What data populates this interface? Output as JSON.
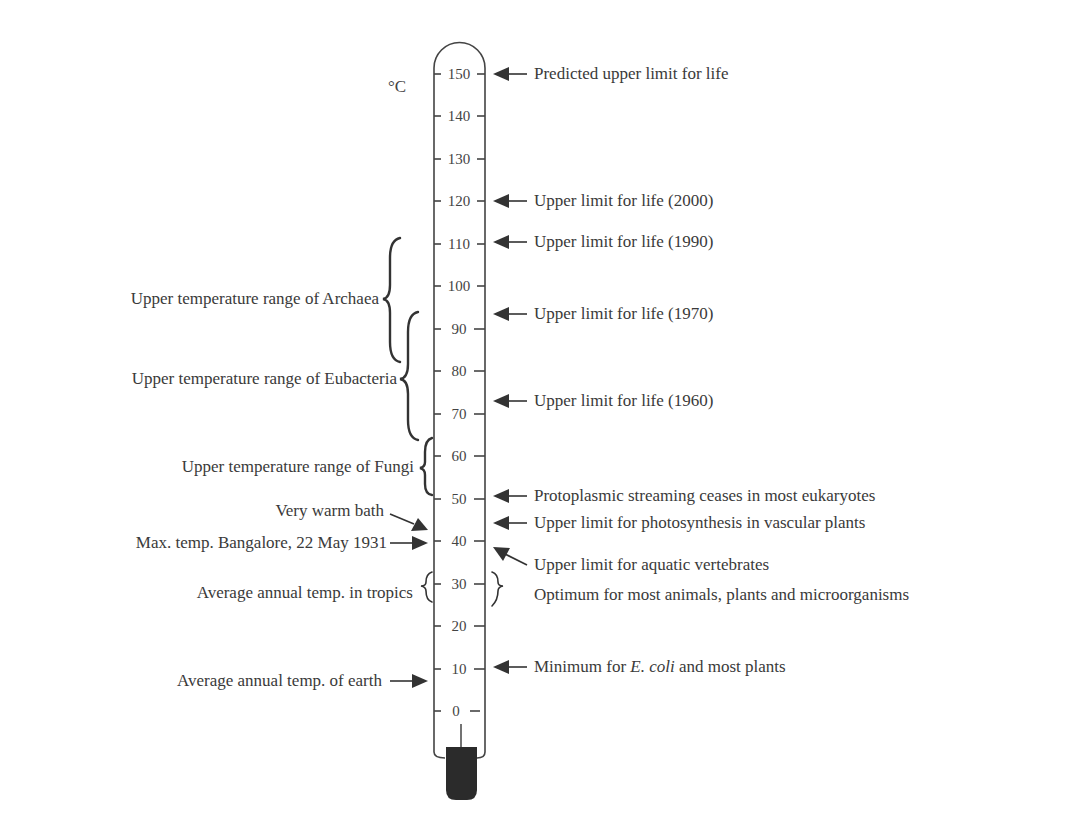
{
  "diagram": {
    "type": "thermometer-scale",
    "unit": "°C",
    "scale": {
      "min": 0,
      "max": 150,
      "step": 10,
      "ticks": [
        "150",
        "140",
        "130",
        "120",
        "110",
        "100",
        "90",
        "80",
        "70",
        "60",
        "50",
        "40",
        "30",
        "20",
        "10",
        "0"
      ]
    },
    "right_annotations": [
      {
        "id": "predicted-upper-limit",
        "text": "Predicted upper limit for life",
        "value": 150
      },
      {
        "id": "upper-limit-2000",
        "text": "Upper limit for life (2000)",
        "value": 120
      },
      {
        "id": "upper-limit-1990",
        "text": "Upper limit for life (1990)",
        "value": 110
      },
      {
        "id": "upper-limit-1970",
        "text": "Upper limit for life (1970)",
        "value": 93
      },
      {
        "id": "upper-limit-1960",
        "text": "Upper limit for life (1960)",
        "value": 73
      },
      {
        "id": "protoplasmic-streaming",
        "text": "Protoplasmic streaming ceases in most eukaryotes",
        "value": 50
      },
      {
        "id": "photosynthesis-limit",
        "text": "Upper limit for photosynthesis in vascular plants",
        "value": 44
      },
      {
        "id": "aquatic-vertebrates",
        "text": "Upper limit for aquatic vertebrates",
        "value": 37
      },
      {
        "id": "optimum",
        "text": "Optimum for most animals, plants and microorganisms",
        "range": [
          25,
          35
        ]
      },
      {
        "id": "ecoli-minimum",
        "text_pre": "Minimum for ",
        "text_italic": "E. coli",
        "text_post": " and most plants",
        "value": 10
      }
    ],
    "left_annotations": [
      {
        "id": "archaea-range",
        "text": "Upper temperature range of Archaea",
        "range": [
          65,
          110
        ]
      },
      {
        "id": "eubacteria-range",
        "text": "Upper temperature range of Eubacteria",
        "range": [
          63,
          95
        ]
      },
      {
        "id": "fungi-range",
        "text": "Upper temperature range of Fungi",
        "range": [
          50,
          64
        ]
      },
      {
        "id": "very-warm-bath",
        "text": "Very warm bath",
        "value": 43
      },
      {
        "id": "max-temp-bangalore",
        "text": "Max. temp. Bangalore, 22 May 1931",
        "value": 40
      },
      {
        "id": "tropics-average",
        "text": "Average annual temp. in tropics",
        "range": [
          25,
          35
        ]
      },
      {
        "id": "earth-average",
        "text": "Average annual temp. of earth",
        "value": 8
      }
    ]
  }
}
